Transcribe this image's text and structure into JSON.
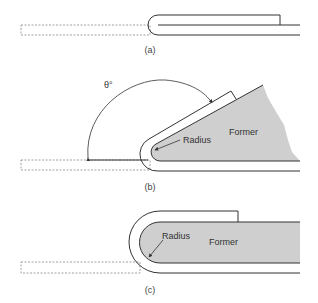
{
  "figure": {
    "panels": [
      {
        "id": "a",
        "caption": "(a)"
      },
      {
        "id": "b",
        "caption": "(b)",
        "angle_label": "θ°",
        "radius_label": "Radius",
        "former_label": "Former"
      },
      {
        "id": "c",
        "caption": "(c)",
        "radius_label": "Radius",
        "former_label": "Former"
      }
    ],
    "colors": {
      "line": "#333333",
      "former_fill": "#cfcfcf",
      "dashed": "#888888",
      "background": "#ffffff"
    }
  }
}
